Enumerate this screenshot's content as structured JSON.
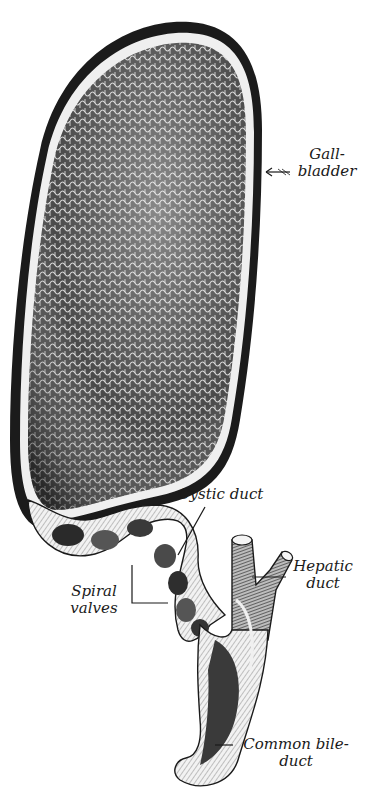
{
  "diagram": {
    "colors": {
      "ink": "#1a1a1a",
      "mucosa_dark": "#3a3a3a",
      "mucosa_mid": "#7a7a7a",
      "wall_light": "#e8e8e8",
      "background": "#ffffff"
    },
    "labels": {
      "gallbladder": {
        "line1": "Gall-",
        "line2": "bladder"
      },
      "cystic_duct": {
        "line1": "Cystic duct"
      },
      "hepatic_duct": {
        "line1": "Hepatic",
        "line2": "duct"
      },
      "spiral_valves": {
        "line1": "Spiral",
        "line2": "valves"
      },
      "common_bile_duct": {
        "line1": "Common bile-",
        "line2": "duct"
      }
    }
  }
}
